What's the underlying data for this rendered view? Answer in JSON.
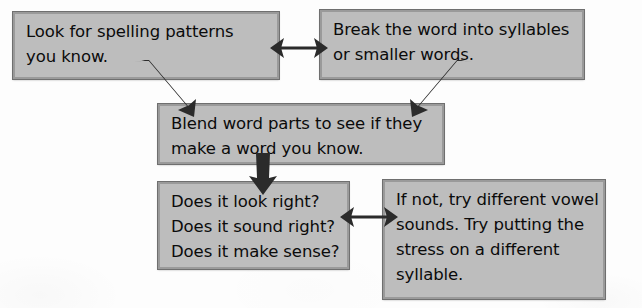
{
  "diagram": {
    "background_color": "#ffffff",
    "box_fill_color": "#bdbdbd",
    "box_border_color": "#6f6f6f",
    "arrow_color": "#2b2b2b",
    "nodes": [
      {
        "id": "spelling-patterns",
        "lines": [
          "Look for spelling patterns",
          "you know."
        ],
        "text": "Look for spelling patterns you know."
      },
      {
        "id": "break-syllables",
        "lines": [
          "Break the word into syllables",
          "or smaller words."
        ],
        "text": "Break the word into syllables or smaller words."
      },
      {
        "id": "blend-parts",
        "lines": [
          "Blend word parts to see if they",
          "make a word you know."
        ],
        "text": "Blend word parts to see if they make a word you know."
      },
      {
        "id": "check-questions",
        "lines": [
          "Does it look right?",
          "Does it sound right?",
          "Does it make sense?"
        ],
        "text": "Does it look right? Does it sound right? Does it make sense?"
      },
      {
        "id": "try-vowels",
        "lines": [
          "If not, try different vowel",
          "sounds. Try putting the",
          "stress on a different",
          "syllable."
        ],
        "text": "If not, try different vowel sounds. Try putting the stress on a different syllable."
      }
    ],
    "connectors": [
      {
        "id": "top-pair",
        "from": "spelling-patterns",
        "to": "break-syllables",
        "style": "double-headed",
        "direction": "horizontal"
      },
      {
        "id": "left-down",
        "from": "spelling-patterns",
        "to": "blend-parts",
        "style": "single-headed",
        "direction": "diagonal-down-right"
      },
      {
        "id": "right-down",
        "from": "break-syllables",
        "to": "blend-parts",
        "style": "single-headed",
        "direction": "diagonal-down-left"
      },
      {
        "id": "mid-down",
        "from": "blend-parts",
        "to": "check-questions",
        "style": "single-headed",
        "direction": "vertical-down"
      },
      {
        "id": "bottom-pair",
        "from": "check-questions",
        "to": "try-vowels",
        "style": "double-headed",
        "direction": "horizontal"
      }
    ]
  }
}
